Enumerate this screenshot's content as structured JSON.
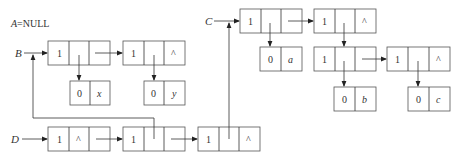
{
  "diagram": {
    "title_label": "A=NULL",
    "pointer_labels": {
      "B": "B",
      "C": "C",
      "D": "D"
    },
    "null_symbol": "^",
    "nodes": {
      "b1": {
        "tag": "1"
      },
      "b2": {
        "tag": "1",
        "tail": "^"
      },
      "x_atom": {
        "tag": "0",
        "value": "x"
      },
      "y_atom": {
        "tag": "0",
        "value": "y"
      },
      "c1": {
        "tag": "1"
      },
      "c2": {
        "tag": "1",
        "tail": "^"
      },
      "a_atom": {
        "tag": "0",
        "value": "a"
      },
      "c3": {
        "tag": "1"
      },
      "c4": {
        "tag": "1",
        "tail": "^"
      },
      "b_atom": {
        "tag": "0",
        "value": "b"
      },
      "c_atom": {
        "tag": "0",
        "value": "c"
      },
      "d1": {
        "tag": "1",
        "head": "^"
      },
      "d2": {
        "tag": "1"
      },
      "d3": {
        "tag": "1",
        "tail": "^"
      }
    }
  }
}
